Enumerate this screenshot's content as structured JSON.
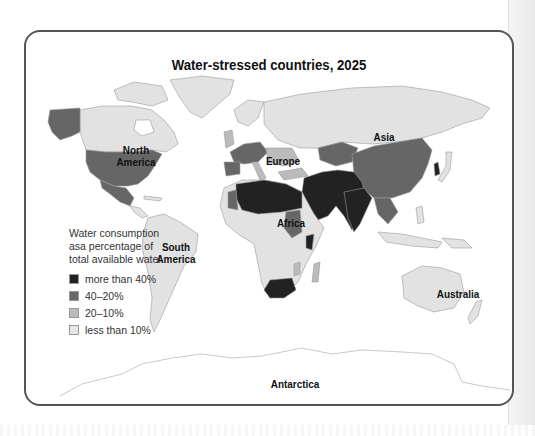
{
  "map": {
    "title": "Water-stressed countries, 2025",
    "regions": [
      {
        "id": "north-america",
        "label_line1": "North",
        "label_line2": "America"
      },
      {
        "id": "south-america",
        "label_line1": "South",
        "label_line2": "America"
      },
      {
        "id": "europe",
        "label_line1": "Europe",
        "label_line2": ""
      },
      {
        "id": "africa",
        "label_line1": "Africa",
        "label_line2": ""
      },
      {
        "id": "asia",
        "label_line1": "Asia",
        "label_line2": ""
      },
      {
        "id": "australia",
        "label_line1": "Australia",
        "label_line2": ""
      },
      {
        "id": "antarctica",
        "label_line1": "Antarctica",
        "label_line2": ""
      }
    ],
    "legend": {
      "title_line1": "Water consumption",
      "title_line2": "asa percentage of",
      "title_line3": "total available water",
      "items": [
        {
          "label": "more than 40%",
          "color": "#222222"
        },
        {
          "label": "40–20%",
          "color": "#666666"
        },
        {
          "label": "20–10%",
          "color": "#bbbbbb"
        },
        {
          "label": "less than 10%",
          "color": "#e6e6e6"
        }
      ]
    },
    "colors": {
      "frame": "#555555",
      "land_low": "#e2e2e2",
      "outline": "#9a9a9a"
    }
  }
}
